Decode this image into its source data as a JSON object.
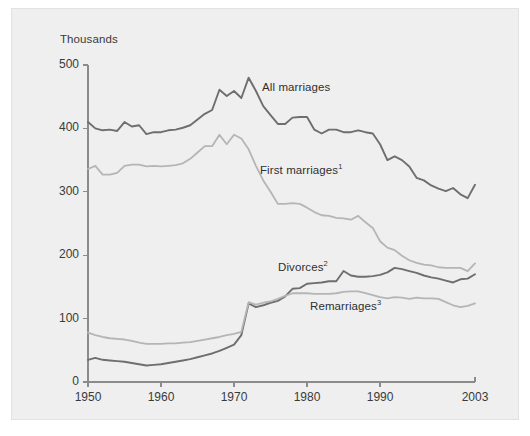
{
  "figure": {
    "background_color": "#efeff0",
    "page_color": "#ffffff",
    "border_color": "#e2e2e3"
  },
  "axes": {
    "y_unit_label": "Thousands",
    "y_ticks": [
      "0",
      "100",
      "200",
      "300",
      "400",
      "500"
    ],
    "x_ticks": [
      "1950",
      "1960",
      "1970",
      "1980",
      "1990",
      "2003"
    ],
    "axis_color": "#8b8b8d"
  },
  "labels": {
    "all_marriages": "All marriages",
    "first_marriages": "First marriages",
    "first_marriages_note": "1",
    "divorces": "Divorces",
    "divorces_note": "2",
    "remarriages": "Remarriages",
    "remarriages_note": "3"
  },
  "chart_data": {
    "type": "line",
    "title": "",
    "subtitle": "",
    "xlabel": "",
    "ylabel": "Thousands",
    "xlim": [
      1950,
      2003
    ],
    "ylim": [
      0,
      500
    ],
    "y_ticks": [
      0,
      100,
      200,
      300,
      400,
      500
    ],
    "x_ticks": [
      1950,
      1960,
      1970,
      1980,
      1990,
      2003
    ],
    "grid": false,
    "legend": "inline-annotations",
    "units": "thousands",
    "x": [
      1950,
      1951,
      1952,
      1953,
      1954,
      1955,
      1956,
      1957,
      1958,
      1959,
      1960,
      1961,
      1962,
      1963,
      1964,
      1965,
      1966,
      1967,
      1968,
      1969,
      1970,
      1971,
      1972,
      1973,
      1974,
      1975,
      1976,
      1977,
      1978,
      1979,
      1980,
      1981,
      1982,
      1983,
      1984,
      1985,
      1986,
      1987,
      1988,
      1989,
      1990,
      1991,
      1992,
      1993,
      1994,
      1995,
      1996,
      1997,
      1998,
      1999,
      2000,
      2001,
      2002,
      2003
    ],
    "series": [
      {
        "name": "All marriages",
        "color": "#6e6e70",
        "width": 1.9,
        "values": [
          410,
          400,
          397,
          398,
          396,
          410,
          403,
          405,
          391,
          394,
          394,
          397,
          398,
          401,
          405,
          414,
          423,
          429,
          461,
          451,
          459,
          448,
          480,
          459,
          435,
          421,
          407,
          407,
          417,
          418,
          418,
          398,
          392,
          398,
          398,
          394,
          394,
          397,
          394,
          392,
          375,
          350,
          356,
          350,
          340,
          322,
          318,
          310,
          305,
          301,
          306,
          296,
          290,
          311
        ]
      },
      {
        "name": "First marriages",
        "color": "#b5b5b7",
        "width": 1.8,
        "values": [
          336,
          341,
          327,
          327,
          330,
          341,
          343,
          343,
          340,
          341,
          340,
          341,
          342,
          345,
          352,
          362,
          372,
          372,
          390,
          375,
          390,
          384,
          367,
          341,
          318,
          300,
          281,
          281,
          282,
          281,
          275,
          268,
          263,
          262,
          259,
          258,
          256,
          262,
          252,
          243,
          222,
          212,
          208,
          199,
          192,
          188,
          185,
          184,
          181,
          180,
          180,
          180,
          175,
          187
        ]
      },
      {
        "name": "Divorces",
        "color": "#6e6e70",
        "width": 1.9,
        "values": [
          35,
          38,
          35,
          34,
          33,
          32,
          30,
          28,
          26,
          27,
          28,
          30,
          32,
          34,
          36,
          39,
          42,
          45,
          49,
          54,
          59,
          74,
          124,
          118,
          121,
          125,
          128,
          135,
          147,
          148,
          155,
          156,
          157,
          159,
          159,
          175,
          168,
          166,
          166,
          167,
          169,
          173,
          180,
          178,
          175,
          172,
          168,
          165,
          163,
          160,
          157,
          162,
          163,
          170
        ]
      },
      {
        "name": "Remarriages",
        "color": "#b5b5b7",
        "width": 1.8,
        "values": [
          78,
          74,
          71,
          69,
          68,
          67,
          65,
          62,
          60,
          60,
          60,
          61,
          61,
          62,
          63,
          65,
          67,
          69,
          71,
          74,
          76,
          79,
          126,
          122,
          125,
          127,
          131,
          136,
          140,
          140,
          140,
          139,
          139,
          139,
          140,
          142,
          143,
          143,
          140,
          137,
          134,
          132,
          134,
          133,
          131,
          133,
          132,
          132,
          131,
          126,
          121,
          118,
          120,
          124
        ]
      }
    ],
    "annotations": [
      {
        "text": "All marriages",
        "x": 1974,
        "y": 435
      },
      {
        "text": "First marriages1",
        "x": 1974,
        "y": 325
      },
      {
        "text": "Divorces2",
        "x": 1976,
        "y": 180
      },
      {
        "text": "Remarriages3",
        "x": 1981,
        "y": 130
      }
    ]
  }
}
